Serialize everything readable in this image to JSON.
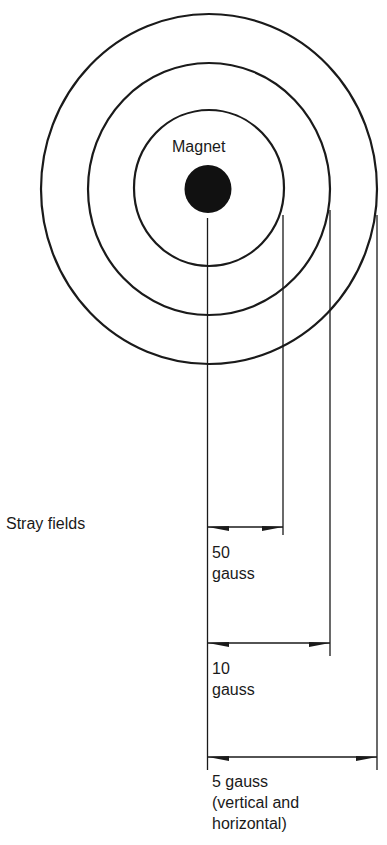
{
  "diagram": {
    "magnet_label": "Magnet",
    "section_label": "Stray fields",
    "rings": [
      {
        "id": "50",
        "value_line": "50",
        "unit_line": "gauss"
      },
      {
        "id": "10",
        "value_line": "10",
        "unit_line": "gauss"
      },
      {
        "id": "5",
        "line1": "5 gauss",
        "line2": "(vertical and",
        "line3": "horizontal)"
      }
    ],
    "colors": {
      "ink": "#1a1a1a",
      "background": "#ffffff"
    }
  }
}
